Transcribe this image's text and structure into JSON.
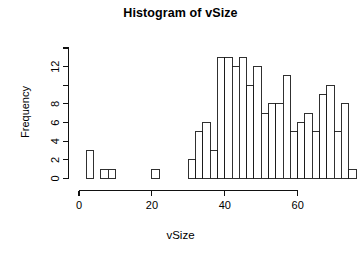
{
  "chart_data": {
    "type": "bar",
    "title": "Histogram of vSize",
    "xlabel": "vSize",
    "ylabel": "Frequency",
    "binwidth": 2,
    "xlim": [
      0,
      76
    ],
    "ylim": [
      0,
      14
    ],
    "grid": false,
    "legend": "none",
    "xticks": [
      0,
      20,
      40,
      60
    ],
    "xtick_labels": [
      "0",
      "20",
      "40",
      "60"
    ],
    "yticks": [
      0,
      2,
      4,
      6,
      8,
      10,
      12,
      14
    ],
    "ytick_labels": [
      "0",
      "2",
      "4",
      "6",
      "8",
      "",
      "12",
      ""
    ],
    "bins": [
      {
        "x0": 2,
        "x1": 4,
        "value": 3
      },
      {
        "x0": 4,
        "x1": 6,
        "value": 0
      },
      {
        "x0": 6,
        "x1": 8,
        "value": 1
      },
      {
        "x0": 8,
        "x1": 10,
        "value": 1
      },
      {
        "x0": 10,
        "x1": 12,
        "value": 0
      },
      {
        "x0": 12,
        "x1": 14,
        "value": 0
      },
      {
        "x0": 14,
        "x1": 16,
        "value": 0
      },
      {
        "x0": 16,
        "x1": 18,
        "value": 0
      },
      {
        "x0": 18,
        "x1": 20,
        "value": 0
      },
      {
        "x0": 20,
        "x1": 22,
        "value": 1
      },
      {
        "x0": 22,
        "x1": 24,
        "value": 0
      },
      {
        "x0": 24,
        "x1": 26,
        "value": 0
      },
      {
        "x0": 26,
        "x1": 28,
        "value": 0
      },
      {
        "x0": 28,
        "x1": 30,
        "value": 0
      },
      {
        "x0": 30,
        "x1": 32,
        "value": 2
      },
      {
        "x0": 32,
        "x1": 34,
        "value": 5
      },
      {
        "x0": 34,
        "x1": 36,
        "value": 6
      },
      {
        "x0": 36,
        "x1": 38,
        "value": 3
      },
      {
        "x0": 38,
        "x1": 40,
        "value": 13
      },
      {
        "x0": 40,
        "x1": 42,
        "value": 13
      },
      {
        "x0": 42,
        "x1": 44,
        "value": 12
      },
      {
        "x0": 44,
        "x1": 46,
        "value": 13
      },
      {
        "x0": 46,
        "x1": 48,
        "value": 10
      },
      {
        "x0": 48,
        "x1": 50,
        "value": 12
      },
      {
        "x0": 50,
        "x1": 52,
        "value": 7
      },
      {
        "x0": 52,
        "x1": 54,
        "value": 8
      },
      {
        "x0": 54,
        "x1": 56,
        "value": 8
      },
      {
        "x0": 56,
        "x1": 58,
        "value": 11
      },
      {
        "x0": 58,
        "x1": 60,
        "value": 5
      },
      {
        "x0": 60,
        "x1": 62,
        "value": 6
      },
      {
        "x0": 62,
        "x1": 64,
        "value": 7
      },
      {
        "x0": 64,
        "x1": 66,
        "value": 5
      },
      {
        "x0": 66,
        "x1": 68,
        "value": 9
      },
      {
        "x0": 68,
        "x1": 70,
        "value": 10
      },
      {
        "x0": 70,
        "x1": 72,
        "value": 5
      },
      {
        "x0": 72,
        "x1": 74,
        "value": 8
      },
      {
        "x0": 74,
        "x1": 76,
        "value": 1
      }
    ]
  }
}
